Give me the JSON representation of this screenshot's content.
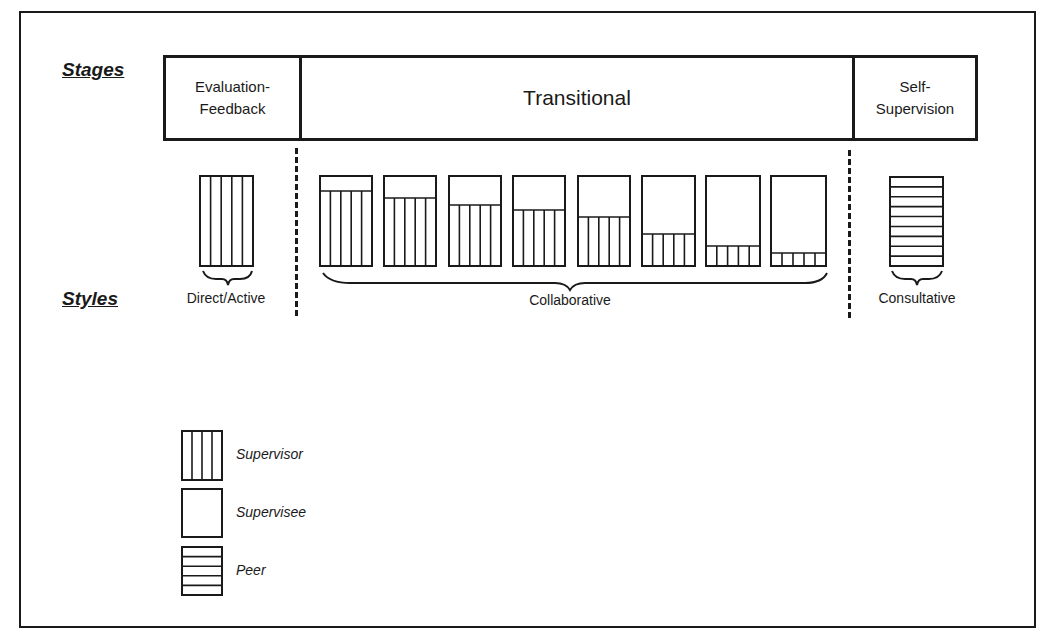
{
  "headings": {
    "stages": "Stages",
    "styles": "Styles"
  },
  "stages": [
    {
      "label_line1": "Evaluation-",
      "label_line2": "Feedback"
    },
    {
      "label_line1": "Transitional",
      "label_line2": ""
    },
    {
      "label_line1": "Self-",
      "label_line2": "Supervision"
    }
  ],
  "styles": {
    "direct": "Direct/Active",
    "collaborative": "Collaborative",
    "consultative": "Consultative"
  },
  "legend": [
    {
      "pattern": "vertical-lines",
      "label": "Supervisor"
    },
    {
      "pattern": "empty",
      "label": "Supervisee"
    },
    {
      "pattern": "horizontal-lines",
      "label": "Peer"
    }
  ],
  "diagram": {
    "line_color": "#1a1a1a",
    "direct_box": {
      "x": 200,
      "y": 176,
      "w": 53,
      "h": 90,
      "columns": 5
    },
    "consultative_box": {
      "x": 890,
      "y": 177,
      "w": 53,
      "h": 89,
      "rows": 9
    },
    "collaborative_boxes": [
      {
        "x": 320,
        "w": 52,
        "split": 191
      },
      {
        "x": 384,
        "w": 52,
        "split": 198
      },
      {
        "x": 449,
        "w": 52,
        "split": 205
      },
      {
        "x": 513,
        "w": 52,
        "split": 210
      },
      {
        "x": 578,
        "w": 52,
        "split": 217
      },
      {
        "x": 642,
        "w": 53,
        "split": 234
      },
      {
        "x": 706,
        "w": 54,
        "split": 246
      },
      {
        "x": 771,
        "w": 55,
        "split": 253
      }
    ],
    "collab_top": 176,
    "collab_bottom": 266,
    "collab_columns": 5,
    "supervisor_share_pct": [
      83,
      76,
      68,
      62,
      54,
      36,
      22,
      14
    ]
  }
}
